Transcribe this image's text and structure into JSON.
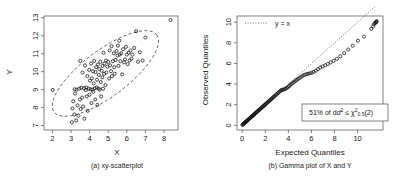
{
  "figure": {
    "background": "#ffffff",
    "panel_count": 2
  },
  "chart_data": [
    {
      "type": "scatter",
      "panel": "a",
      "title": "",
      "caption": "(a) xy-scatterplot",
      "xlabel": "X",
      "ylabel": "Y",
      "xlim": [
        1.55,
        8.75
      ],
      "ylim": [
        6.75,
        13.1
      ],
      "xticks": [
        2,
        3,
        4,
        5,
        6,
        7,
        8
      ],
      "yticks": [
        7,
        8,
        9,
        10,
        11,
        12,
        13
      ],
      "grid": false,
      "marker": "open-circle",
      "annotations": [
        {
          "name": "confidence-ellipse",
          "style": "dashed",
          "center_x": 4.85,
          "center_y": 9.9,
          "angle_deg": -37
        }
      ],
      "x": [
        2.02,
        3.05,
        3.08,
        3.12,
        3.18,
        3.2,
        3.22,
        3.28,
        3.3,
        3.35,
        3.4,
        3.45,
        3.48,
        3.5,
        3.52,
        3.55,
        3.6,
        3.62,
        3.65,
        3.7,
        3.72,
        3.75,
        3.8,
        3.82,
        3.85,
        3.88,
        3.9,
        3.95,
        3.98,
        4.0,
        4.02,
        4.05,
        4.08,
        4.1,
        4.12,
        4.15,
        4.18,
        4.2,
        4.22,
        4.25,
        4.28,
        4.3,
        4.32,
        4.35,
        4.38,
        4.4,
        4.42,
        4.45,
        4.48,
        4.5,
        4.52,
        4.55,
        4.58,
        4.6,
        4.62,
        4.65,
        4.68,
        4.7,
        4.72,
        4.75,
        4.78,
        4.8,
        4.85,
        4.88,
        4.9,
        4.95,
        5.0,
        5.05,
        5.08,
        5.1,
        5.15,
        5.18,
        5.2,
        5.25,
        5.3,
        5.32,
        5.35,
        5.4,
        5.45,
        5.5,
        5.52,
        5.55,
        5.6,
        5.62,
        5.65,
        5.7,
        5.75,
        5.8,
        5.85,
        5.9,
        5.95,
        6.0,
        6.05,
        6.1,
        6.15,
        6.2,
        6.25,
        6.3,
        6.4,
        6.5,
        6.6,
        6.7,
        6.85,
        7.0,
        8.35
      ],
      "y": [
        8.98,
        7.18,
        7.95,
        8.35,
        7.62,
        9.02,
        8.78,
        7.28,
        9.0,
        8.12,
        7.55,
        9.05,
        8.45,
        10.6,
        7.92,
        9.1,
        8.55,
        9.95,
        8.05,
        9.08,
        7.38,
        10.35,
        8.98,
        9.12,
        8.62,
        9.75,
        7.82,
        9.05,
        10.1,
        8.72,
        9.5,
        9.02,
        10.45,
        8.25,
        9.62,
        9.0,
        10.02,
        8.88,
        9.35,
        10.6,
        9.08,
        8.45,
        9.98,
        10.25,
        9.12,
        9.55,
        8.15,
        10.4,
        9.05,
        9.82,
        10.15,
        9.0,
        10.55,
        9.42,
        8.62,
        10.05,
        9.68,
        10.32,
        9.05,
        11.05,
        9.88,
        10.45,
        9.25,
        10.62,
        9.95,
        10.28,
        10.55,
        9.62,
        11.18,
        10.35,
        10.02,
        11.42,
        9.75,
        10.58,
        11.02,
        10.25,
        9.88,
        10.65,
        11.15,
        10.9,
        11.45,
        10.32,
        11.72,
        10.95,
        10.58,
        11.02,
        9.85,
        11.25,
        10.52,
        10.68,
        11.38,
        10.95,
        10.42,
        11.05,
        10.62,
        11.18,
        10.72,
        10.95,
        11.32,
        12.25,
        10.55,
        11.08,
        10.62,
        11.9,
        12.88
      ]
    },
    {
      "type": "scatter",
      "panel": "b",
      "title": "",
      "caption": "(b) Gamma plot of X and Y",
      "xlabel": "Expected Quantiles",
      "ylabel": "Observed Quantiles",
      "xlim": [
        -0.45,
        12.2
      ],
      "ylim": [
        -0.45,
        10.6
      ],
      "xticks": [
        0,
        2,
        4,
        6,
        8,
        10
      ],
      "yticks": [
        0,
        2,
        4,
        6,
        8,
        10
      ],
      "grid": false,
      "marker": "open-circle",
      "reference_line": {
        "label": "y = x",
        "style": "dotted",
        "slope": 1,
        "intercept": 0
      },
      "legend": {
        "label": "y = x",
        "position": "top-left"
      },
      "annotation_box": {
        "text": "51% of d² ≤ χ²₀.₅(2)",
        "text_plain": "51% of d2 <= chi2_0.5(2)",
        "percent": 51,
        "position": "bottom-right"
      },
      "x": [
        0.02,
        0.06,
        0.1,
        0.14,
        0.18,
        0.22,
        0.26,
        0.3,
        0.34,
        0.38,
        0.43,
        0.47,
        0.52,
        0.56,
        0.61,
        0.66,
        0.7,
        0.75,
        0.8,
        0.85,
        0.9,
        0.95,
        1.0,
        1.05,
        1.1,
        1.16,
        1.21,
        1.26,
        1.32,
        1.37,
        1.43,
        1.49,
        1.54,
        1.6,
        1.66,
        1.72,
        1.78,
        1.84,
        1.9,
        1.97,
        2.03,
        2.1,
        2.16,
        2.23,
        2.3,
        2.37,
        2.44,
        2.51,
        2.58,
        2.66,
        2.73,
        2.81,
        2.89,
        2.97,
        3.05,
        3.13,
        3.22,
        3.3,
        3.39,
        3.48,
        3.57,
        3.67,
        3.76,
        3.86,
        3.96,
        4.07,
        4.17,
        4.28,
        4.39,
        4.51,
        4.63,
        4.75,
        4.87,
        5.0,
        5.13,
        5.27,
        5.41,
        5.56,
        5.71,
        5.87,
        6.03,
        6.2,
        6.38,
        6.57,
        6.76,
        6.97,
        7.19,
        7.42,
        7.66,
        7.92,
        8.2,
        8.5,
        8.83,
        9.18,
        9.58,
        10.03,
        10.55,
        11.18,
        11.35,
        11.42,
        11.5,
        11.55,
        11.6,
        11.62,
        11.65
      ],
      "y": [
        0.04,
        0.09,
        0.13,
        0.17,
        0.21,
        0.25,
        0.28,
        0.32,
        0.36,
        0.41,
        0.45,
        0.5,
        0.55,
        0.59,
        0.64,
        0.69,
        0.73,
        0.78,
        0.83,
        0.88,
        0.93,
        0.98,
        1.03,
        1.08,
        1.13,
        1.19,
        1.24,
        1.29,
        1.35,
        1.4,
        1.46,
        1.52,
        1.57,
        1.63,
        1.69,
        1.75,
        1.81,
        1.87,
        1.93,
        2.0,
        2.06,
        2.13,
        2.19,
        2.26,
        2.33,
        2.4,
        2.47,
        2.54,
        2.61,
        2.69,
        2.76,
        2.84,
        2.92,
        3.0,
        3.08,
        3.16,
        3.25,
        3.33,
        3.42,
        3.45,
        3.47,
        3.5,
        3.55,
        3.62,
        3.7,
        3.8,
        3.92,
        4.02,
        4.12,
        4.22,
        4.32,
        4.42,
        4.52,
        4.62,
        4.72,
        4.82,
        4.9,
        4.96,
        5.0,
        5.05,
        5.1,
        5.18,
        5.3,
        5.45,
        5.6,
        5.72,
        5.82,
        5.95,
        6.1,
        6.25,
        6.45,
        6.7,
        7.0,
        7.35,
        7.72,
        8.2,
        8.6,
        9.35,
        9.6,
        9.8,
        9.9,
        9.95,
        10.0,
        10.05,
        10.1
      ]
    }
  ],
  "panel_a": {
    "caption": "(a) xy-scatterplot",
    "xlabel": "X",
    "ylabel": "Y",
    "xticks": [
      "2",
      "3",
      "4",
      "5",
      "6",
      "7",
      "8"
    ],
    "yticks": [
      "7",
      "8",
      "9",
      "10",
      "11",
      "12",
      "13"
    ]
  },
  "panel_b": {
    "caption": "(b) Gamma plot of X and Y",
    "xlabel": "Expected Quantiles",
    "ylabel": "Observed Quantiles",
    "xticks": [
      "0",
      "2",
      "4",
      "6",
      "8",
      "10"
    ],
    "yticks": [
      "0",
      "2",
      "4",
      "6",
      "8",
      "10"
    ],
    "legend_label": "y = x",
    "box_prefix": "51% of d",
    "box_sup1": "2",
    "box_mid": " ≤ χ",
    "box_sup2": "2",
    "box_sub": "0.5",
    "box_suffix": "(2)"
  },
  "colors": {
    "axis": "#4d4d4d",
    "point": "#111111",
    "text": "#1a1a1a",
    "background": "#ffffff"
  }
}
